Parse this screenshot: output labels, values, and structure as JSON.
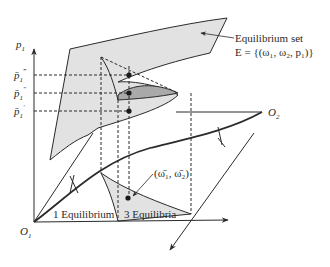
{
  "diagram": {
    "type": "equilibrium-manifold-3d",
    "axis_label_p1": "p",
    "axis_label_p1_sub": "1",
    "origin_1_label": "O",
    "origin_1_sub": "1",
    "origin_2_label": "O",
    "origin_2_sub": "2",
    "price_levels": [
      {
        "label": "p̄",
        "sub": "1",
        "prime": "‴"
      },
      {
        "label": "p̄",
        "sub": "1",
        "prime": "″"
      },
      {
        "label": "p̄",
        "sub": "1",
        "prime": "′"
      }
    ],
    "annotation_title": "Equilibrium set",
    "annotation_formula": "E = {(ω₁, ω₂, p₁)}",
    "point_label": "(ω̄₁, ω̄₂)",
    "region_one_label": "1 Equilibrium",
    "region_three_label": "3 Equilibria",
    "colors": {
      "surface_fill": "#e2e2e2",
      "fold_fill": "#a9a9a9",
      "line": "#2a2a2a"
    }
  }
}
